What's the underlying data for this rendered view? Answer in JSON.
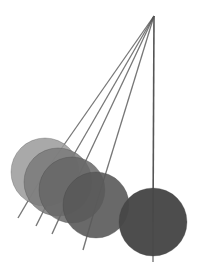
{
  "scene": {
    "subject": "pendulum-multiple-exposure",
    "background": "#ffffff",
    "pivot": {
      "x": 154,
      "y": 16
    },
    "string_color": "#555555",
    "positions": [
      {
        "cx": 45,
        "cy": 172,
        "r": 34,
        "fill": "#9a9a9a",
        "opacity": 0.85,
        "tail_x": 18,
        "tail_y": 218
      },
      {
        "cx": 58,
        "cy": 182,
        "r": 34,
        "fill": "#7a7a7a",
        "opacity": 0.85,
        "tail_x": 36,
        "tail_y": 226
      },
      {
        "cx": 72,
        "cy": 190,
        "r": 33,
        "fill": "#666666",
        "opacity": 0.85,
        "tail_x": 52,
        "tail_y": 234
      },
      {
        "cx": 96,
        "cy": 205,
        "r": 33,
        "fill": "#595959",
        "opacity": 0.9,
        "tail_x": 83,
        "tail_y": 250
      },
      {
        "cx": 153,
        "cy": 222,
        "r": 34,
        "fill": "#474747",
        "opacity": 0.97,
        "tail_x": 153,
        "tail_y": 262
      }
    ]
  }
}
